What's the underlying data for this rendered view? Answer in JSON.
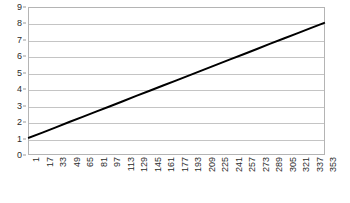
{
  "chart_data": {
    "type": "line",
    "title": "",
    "subtitle": "",
    "xlabel": "",
    "ylabel": "",
    "grid": true,
    "legend": false,
    "legend_position": "none",
    "xlim": [
      1,
      353
    ],
    "ylim": [
      0,
      9
    ],
    "y_ticks": [
      9,
      8,
      7,
      6,
      5,
      4,
      3,
      2,
      1,
      0
    ],
    "x_ticks": [
      1,
      17,
      33,
      49,
      65,
      81,
      97,
      113,
      129,
      145,
      161,
      177,
      193,
      209,
      225,
      241,
      257,
      273,
      289,
      305,
      321,
      337,
      353
    ],
    "x_tick_rotation": -90,
    "x_tick_step": 16,
    "series": [
      {
        "name": "series-1",
        "color": "#000000",
        "line_width": 2,
        "x": [
          1,
          17,
          33,
          49,
          65,
          81,
          97,
          113,
          129,
          145,
          161,
          177,
          193,
          209,
          225,
          241,
          257,
          273,
          289,
          305,
          321,
          337,
          353
        ],
        "values": [
          1.0,
          1.32,
          1.64,
          1.97,
          2.29,
          2.61,
          2.93,
          3.25,
          3.58,
          3.9,
          4.22,
          4.54,
          4.86,
          5.19,
          5.51,
          5.83,
          6.15,
          6.47,
          6.8,
          7.12,
          7.44,
          7.76,
          8.08
        ]
      }
    ]
  },
  "style": {
    "background": "#ffffff",
    "grid_color": "#c4c4c4",
    "frame_color": "#b4b4b4",
    "tick_label_color": "#2b2b2b",
    "series_color": "#000000"
  }
}
